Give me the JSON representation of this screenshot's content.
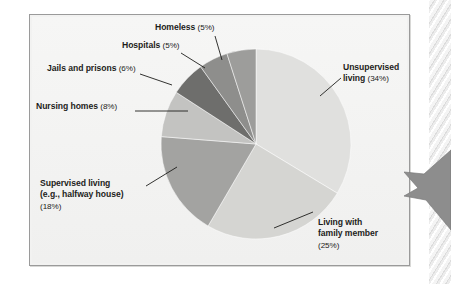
{
  "figure": {
    "background_color": "#f4f4f3",
    "frame_border_color": "#9a9a9a",
    "decoration": {
      "binding_name": "spiral-binding",
      "arrow_name": "page-marker-arrow",
      "arrow_color": "#8d8d8d"
    }
  },
  "chart_data": {
    "type": "pie",
    "title": "",
    "start_angle_deg": 0,
    "direction": "clockwise",
    "total_percent": 100,
    "labels": [
      "Unsupervised living",
      "Living with family member",
      "Supervised living (e.g., halfway house)",
      "Nursing homes",
      "Jails and prisons",
      "Hospitals",
      "Homeless"
    ],
    "values": [
      34,
      25,
      18,
      8,
      6,
      5,
      5
    ],
    "colors": [
      "#e0e0de",
      "#d5d5d2",
      "#a3a3a1",
      "#c3c3c1",
      "#6e6e6c",
      "#8e8e8c",
      "#9d9d9b"
    ],
    "slices": [
      {
        "id": "unsupervised-living",
        "name": "Unsupervised living",
        "value": 34,
        "percent_label": "(34%)",
        "color": "#e0e0de",
        "label_lines": [
          "Unsupervised",
          "living (34%)"
        ]
      },
      {
        "id": "living-with-family-member",
        "name": "Living with family member",
        "value": 25,
        "percent_label": "(25%)",
        "color": "#d5d5d2",
        "label_lines": [
          "Living with",
          "family member",
          "(25%)"
        ]
      },
      {
        "id": "supervised-living",
        "name": "Supervised living (e.g., halfway house)",
        "value": 18,
        "percent_label": "(18%)",
        "color": "#a3a3a1",
        "label_lines": [
          "Supervised living",
          "(e.g., halfway house)",
          "(18%)"
        ]
      },
      {
        "id": "nursing-homes",
        "name": "Nursing homes",
        "value": 8,
        "percent_label": "(8%)",
        "color": "#c3c3c1",
        "label_lines": [
          "Nursing homes (8%)"
        ]
      },
      {
        "id": "jails-and-prisons",
        "name": "Jails and prisons",
        "value": 6,
        "percent_label": "(6%)",
        "color": "#6e6e6c",
        "label_lines": [
          "Jails and prisons (6%)"
        ]
      },
      {
        "id": "hospitals",
        "name": "Hospitals",
        "value": 5,
        "percent_label": "(5%)",
        "color": "#8e8e8c",
        "label_lines": [
          "Hospitals (5%)"
        ]
      },
      {
        "id": "homeless",
        "name": "Homeless",
        "value": 5,
        "percent_label": "(5%)",
        "color": "#9d9d9b",
        "label_lines": [
          "Homeless (5%)"
        ]
      }
    ],
    "legend_position": "callout-labels",
    "grid": false
  },
  "labels": {
    "homeless": {
      "text": "Homeless ",
      "pct": "(5%)"
    },
    "hospitals": {
      "text": "Hospitals ",
      "pct": "(5%)"
    },
    "jails": {
      "text": "Jails and prisons ",
      "pct": "(6%)"
    },
    "nursing": {
      "text": "Nursing homes ",
      "pct": "(8%)"
    },
    "supervised_l1": {
      "text": "Supervised living"
    },
    "supervised_l2": {
      "text": "(e.g., halfway house)"
    },
    "supervised_l3": {
      "pct": "(18%)"
    },
    "unsupervised_l1": {
      "text": "Unsupervised"
    },
    "unsupervised_l2": {
      "text": "living ",
      "pct": "(34%)"
    },
    "family_l1": {
      "text": "Living with"
    },
    "family_l2": {
      "text": "family member"
    },
    "family_l3": {
      "pct": "(25%)"
    }
  }
}
